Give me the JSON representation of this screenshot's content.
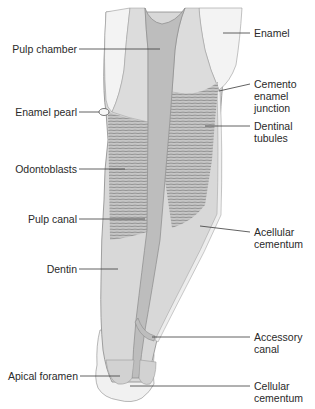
{
  "figure": {
    "colors": {
      "background": "#ffffff",
      "enamel": "#f2f2f2",
      "dentin": "#d6d6d6",
      "pulp": "#bdbdbd",
      "tubule_band": "#c8c8c8",
      "tubule_line": "#8a8a8a",
      "cementum": "#ebebeb",
      "outline": "#8c8c8c",
      "leader_line": "#3a3a3a",
      "label_text": "#2a2a2a"
    }
  },
  "labels_left": [
    {
      "id": "pulp-chamber",
      "text": "Pulp chamber"
    },
    {
      "id": "enamel-pearl",
      "text": "Enamel pearl"
    },
    {
      "id": "odontoblasts",
      "text": "Odontoblasts"
    },
    {
      "id": "pulp-canal",
      "text": "Pulp canal"
    },
    {
      "id": "dentin",
      "text": "Dentin"
    },
    {
      "id": "apical-foramen",
      "text": "Apical foramen"
    }
  ],
  "labels_right": [
    {
      "id": "enamel",
      "text": "Enamel"
    },
    {
      "id": "cemento-enamel-junction",
      "text": "Cemento\nenamel\njunction"
    },
    {
      "id": "dentinal-tubules",
      "text": "Dentinal\ntubules"
    },
    {
      "id": "acellular-cementum",
      "text": "Acellular\ncementum"
    },
    {
      "id": "accessory-canal",
      "text": "Accessory\ncanal"
    },
    {
      "id": "cellular-cementum",
      "text": "Cellular\ncementum"
    }
  ]
}
